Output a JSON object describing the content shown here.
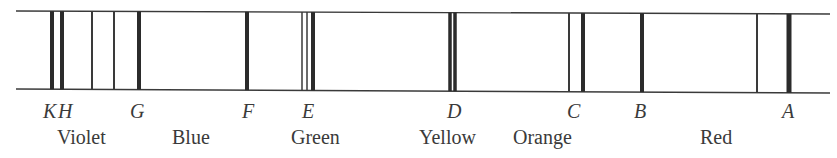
{
  "diagram": {
    "type": "solar-spectrum-fraunhofer-lines",
    "frame": {
      "x_start": 16,
      "x_end": 830,
      "top_y_left": 11,
      "top_y_right": 14,
      "bottom_y_left": 89,
      "bottom_y_right": 93,
      "stroke": "#3a3a3a"
    },
    "lines": [
      {
        "id": "K",
        "x": 52,
        "width": 4,
        "color": "#2b2b2b"
      },
      {
        "id": "H",
        "x": 62,
        "width": 4,
        "color": "#2b2b2b"
      },
      {
        "id": "violet-thin-1",
        "x": 92,
        "width": 2,
        "color": "#3a3a3a"
      },
      {
        "id": "violet-thin-2",
        "x": 114,
        "width": 2,
        "color": "#3a3a3a"
      },
      {
        "id": "G",
        "x": 139,
        "width": 4,
        "color": "#2b2b2b"
      },
      {
        "id": "F",
        "x": 247,
        "width": 4,
        "color": "#2b2b2b"
      },
      {
        "id": "E-thin-1",
        "x": 302,
        "width": 1.5,
        "color": "#3a3a3a"
      },
      {
        "id": "E-thin-2",
        "x": 307,
        "width": 1.5,
        "color": "#3a3a3a"
      },
      {
        "id": "E",
        "x": 313,
        "width": 4,
        "color": "#2b2b2b"
      },
      {
        "id": "D1",
        "x": 450,
        "width": 3.5,
        "color": "#2b2b2b"
      },
      {
        "id": "D2",
        "x": 455,
        "width": 3.5,
        "color": "#2b2b2b"
      },
      {
        "id": "C-thin",
        "x": 569,
        "width": 2,
        "color": "#3a3a3a"
      },
      {
        "id": "C",
        "x": 583,
        "width": 4,
        "color": "#2b2b2b"
      },
      {
        "id": "B",
        "x": 642,
        "width": 4,
        "color": "#2b2b2b"
      },
      {
        "id": "red-thin",
        "x": 757,
        "width": 2,
        "color": "#3a3a3a"
      },
      {
        "id": "A",
        "x": 789,
        "width": 5,
        "color": "#2b2b2b"
      }
    ],
    "letter_labels": [
      {
        "text": "K",
        "x": 43
      },
      {
        "text": "H",
        "x": 58
      },
      {
        "text": "G",
        "x": 130
      },
      {
        "text": "F",
        "x": 242
      },
      {
        "text": "E",
        "x": 302
      },
      {
        "text": "D",
        "x": 447
      },
      {
        "text": "C",
        "x": 567
      },
      {
        "text": "B",
        "x": 634
      },
      {
        "text": "A",
        "x": 782
      }
    ],
    "color_labels": [
      {
        "text": "Violet",
        "x": 57
      },
      {
        "text": "Blue",
        "x": 172
      },
      {
        "text": "Green",
        "x": 291
      },
      {
        "text": "Yellow",
        "x": 419
      },
      {
        "text": "Orange",
        "x": 513
      },
      {
        "text": "Red",
        "x": 700
      }
    ]
  }
}
